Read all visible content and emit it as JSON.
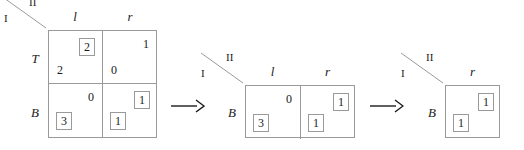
{
  "figure": {
    "line_color": "#9a9a9a",
    "text_color": "#1a1a1a",
    "box_color": "#9a9a9a",
    "background": "#ffffff"
  },
  "corner": {
    "player_row": "I",
    "player_col": "II"
  },
  "stages": [
    {
      "name": "stage-1",
      "columns": [
        "l",
        "r"
      ],
      "rows": [
        "T",
        "B"
      ],
      "cells": [
        {
          "row": "T",
          "col": "l",
          "col_payoff": "2",
          "col_boxed": true,
          "row_payoff": "2",
          "row_boxed": false
        },
        {
          "row": "T",
          "col": "r",
          "col_payoff": "1",
          "col_boxed": false,
          "row_payoff": "0",
          "row_boxed": false
        },
        {
          "row": "B",
          "col": "l",
          "col_payoff": "0",
          "col_boxed": false,
          "row_payoff": "3",
          "row_boxed": true
        },
        {
          "row": "B",
          "col": "r",
          "col_payoff": "1",
          "col_boxed": true,
          "row_payoff": "1",
          "row_boxed": true
        }
      ]
    },
    {
      "name": "stage-2",
      "columns": [
        "l",
        "r"
      ],
      "rows": [
        "B"
      ],
      "cells": [
        {
          "row": "B",
          "col": "l",
          "col_payoff": "0",
          "col_boxed": false,
          "row_payoff": "3",
          "row_boxed": true
        },
        {
          "row": "B",
          "col": "r",
          "col_payoff": "1",
          "col_boxed": true,
          "row_payoff": "1",
          "row_boxed": true
        }
      ]
    },
    {
      "name": "stage-3",
      "columns": [
        "r"
      ],
      "rows": [
        "B"
      ],
      "cells": [
        {
          "row": "B",
          "col": "r",
          "col_payoff": "1",
          "col_boxed": true,
          "row_payoff": "1",
          "row_boxed": true
        }
      ]
    }
  ],
  "arrows": [
    {
      "name": "arrow-1",
      "glyph": "→"
    },
    {
      "name": "arrow-2",
      "glyph": "→"
    }
  ]
}
